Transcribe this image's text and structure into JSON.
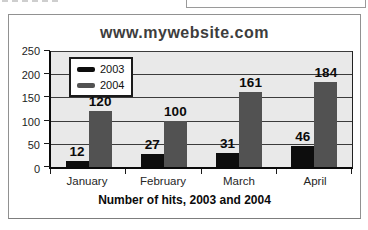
{
  "chart": {
    "title": "www.mywebsite.com",
    "caption": "Number of hits, 2003 and 2004"
  },
  "chart_data": {
    "type": "bar",
    "title": "www.mywebsite.com",
    "xlabel": "Number of hits, 2003 and 2004",
    "ylabel": "",
    "categories": [
      "January",
      "February",
      "March",
      "April"
    ],
    "series": [
      {
        "name": "2003",
        "values": [
          12,
          27,
          31,
          46
        ],
        "color": "#0d0d0d"
      },
      {
        "name": "2004",
        "values": [
          120,
          100,
          161,
          184
        ],
        "color": "#525252"
      }
    ],
    "ylim": [
      0,
      250
    ],
    "yticks": [
      0,
      50,
      100,
      150,
      200,
      250
    ],
    "grid": true,
    "legend_position": "top-left",
    "plot_background": "#e9e9e9",
    "data_labels": true
  }
}
